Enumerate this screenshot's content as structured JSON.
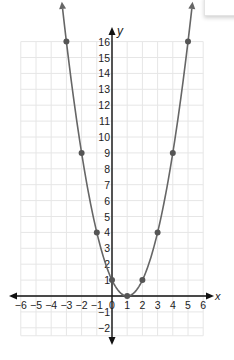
{
  "chart_data": {
    "type": "line",
    "title": "",
    "equation_implied": "y = (x - 1)^2",
    "xlabel": "x",
    "ylabel": "y",
    "xlim": [
      -6,
      6
    ],
    "ylim": [
      -2,
      16
    ],
    "grid": true,
    "x_ticks": [
      -6,
      -5,
      -4,
      -3,
      -2,
      -1,
      0,
      1,
      2,
      3,
      4,
      5,
      6
    ],
    "y_ticks": [
      -2,
      -1,
      1,
      2,
      3,
      4,
      5,
      6,
      7,
      8,
      9,
      10,
      11,
      12,
      13,
      14,
      15,
      16
    ],
    "x_tick_labels": [
      "−6",
      "−5",
      "−4",
      "−3",
      "−2",
      "−1",
      "0",
      "1",
      "2",
      "3",
      "4",
      "5",
      "6"
    ],
    "y_tick_labels": [
      "−2",
      "−1",
      "1",
      "2",
      "3",
      "4",
      "5",
      "6",
      "7",
      "8",
      "9",
      "10",
      "11",
      "12",
      "13",
      "14",
      "15",
      "16"
    ],
    "series": [
      {
        "name": "parabola",
        "points": [
          {
            "x": -3,
            "y": 16
          },
          {
            "x": -2,
            "y": 9
          },
          {
            "x": -1,
            "y": 4
          },
          {
            "x": 0,
            "y": 1
          },
          {
            "x": 1,
            "y": 0
          },
          {
            "x": 2,
            "y": 1
          },
          {
            "x": 3,
            "y": 4
          },
          {
            "x": 4,
            "y": 9
          },
          {
            "x": 5,
            "y": 16
          }
        ],
        "curve_color": "#666666",
        "point_color": "#555555",
        "arrows_at_ends": true
      }
    ]
  },
  "colors": {
    "grid": "#e6e6e6",
    "axis": "#111111",
    "curve": "#666666",
    "point": "#555555",
    "text": "#222222"
  }
}
